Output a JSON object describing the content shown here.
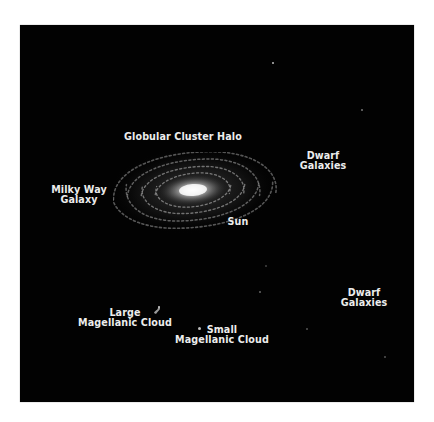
{
  "figure": {
    "background": "#020202",
    "text_color": "#ececec"
  },
  "labels": {
    "globular_cluster_halo": "Globular Cluster Halo",
    "milky_way": {
      "line1": "Milky Way",
      "line2": "Galaxy"
    },
    "sun": "Sun",
    "dwarf_galaxies_upper": {
      "line1": "Dwarf",
      "line2": "Galaxies"
    },
    "dwarf_galaxies_lower": {
      "line1": "Dwarf",
      "line2": "Galaxies"
    },
    "large_magellanic_cloud": {
      "line1": "Large",
      "line2": "Magellanic Cloud"
    },
    "small_magellanic_cloud": {
      "line1": "Small",
      "line2": "Magellanic Cloud"
    }
  }
}
